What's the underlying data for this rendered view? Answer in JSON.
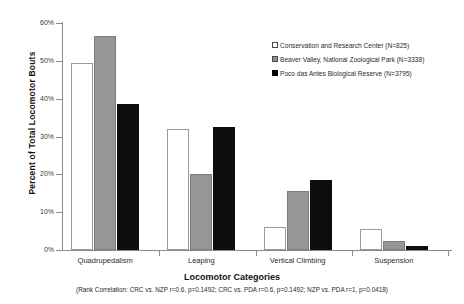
{
  "chart_data": {
    "type": "bar",
    "title": "",
    "xlabel": "Locomotor Categories",
    "ylabel": "Percent of Total Locomotor Bouts",
    "ylim": [
      0,
      60
    ],
    "ytick_labels": [
      "0%",
      "10%",
      "20%",
      "30%",
      "40%",
      "50%",
      "60%"
    ],
    "ytick_values": [
      0,
      10,
      20,
      30,
      40,
      50,
      60
    ],
    "grid": false,
    "legend_position": "top-right",
    "categories": [
      "Quadrupedalism",
      "Leaping",
      "Vertical Climbing",
      "Suspension"
    ],
    "series": [
      {
        "name": "Conservation and Research Center (N=825)",
        "short": "CRC",
        "color": "#ffffff",
        "swatch": "white",
        "values": [
          49.5,
          32.0,
          6.0,
          5.5
        ]
      },
      {
        "name": "Beaver Valley, National Zoological Park (N=3338)",
        "short": "NZP",
        "color": "#969696",
        "swatch": "gray",
        "values": [
          56.5,
          20.0,
          15.5,
          2.5
        ]
      },
      {
        "name": "Poco das Antes Biological Reserve (N=3795)",
        "short": "PDA",
        "color": "#0d0d0d",
        "swatch": "black",
        "values": [
          38.5,
          32.5,
          18.5,
          1.0
        ]
      }
    ],
    "caption": "(Rank Correlation: CRC vs. NZP r=0.6, p=0.1492; CRC vs. PDA r=0.6, p=0.1492; NZP vs. PDA r=1, p=0.0418)"
  }
}
